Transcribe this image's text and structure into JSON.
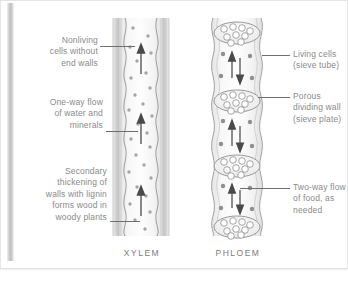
{
  "figure": {
    "title_left": "XYLEM",
    "title_right": "PHLOEM",
    "background_color": "#ffffff",
    "text_color": "#8a8a8a",
    "line_color": "#6f6f6f",
    "tissue_fill": "#f2f2f2",
    "dot_color": "#9a9a9a"
  },
  "labels": {
    "left": [
      {
        "id": "nonliving-cells",
        "text": "Nonliving\ncells without\nend walls"
      },
      {
        "id": "one-way-flow",
        "text": "One-way flow\nof water and\nminerals"
      },
      {
        "id": "secondary-thickening",
        "text": "Secondary\nthickening of\nwalls with lignin\nforms wood in\nwoody plants"
      }
    ],
    "right": [
      {
        "id": "living-cells",
        "text": "Living cells\n(sieve tube)"
      },
      {
        "id": "porous-dividing-wall",
        "text": "Porous\ndividing wall\n(sieve plate)"
      },
      {
        "id": "two-way-flow",
        "text": "Two-way flow\nof food, as\nneeded"
      }
    ]
  },
  "diagram": {
    "xylem": {
      "name": "xylem-vessel",
      "description": "vertical hollow tube, wavy inner walls, no end walls",
      "arrow_direction": "up",
      "arrow_count": 3,
      "dot_count": 26
    },
    "phloem": {
      "name": "phloem-sieve-tube",
      "description": "stacked living cells separated by porous sieve plates",
      "arrow_direction": "both",
      "cell_count": 3,
      "sieve_plate_count": 4,
      "pores_per_plate": 9
    }
  }
}
